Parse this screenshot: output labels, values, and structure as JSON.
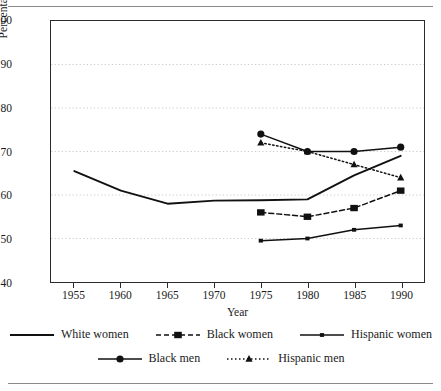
{
  "chart_data": {
    "type": "line",
    "title": "",
    "xlabel": "Year",
    "ylabel": "Percentage of White Men's Income",
    "xlim": [
      1952.5,
      1992.5
    ],
    "ylim": [
      40,
      100
    ],
    "xticks": [
      1955,
      1960,
      1965,
      1970,
      1975,
      1980,
      1985,
      1990
    ],
    "yticks": [
      40,
      50,
      60,
      70,
      80,
      90,
      100
    ],
    "grid": "horizontal-dotted",
    "legend_position": "below-axis",
    "series": [
      {
        "name": "White women",
        "style": "solid",
        "marker": "none",
        "x": [
          1955,
          1960,
          1965,
          1970,
          1975,
          1980,
          1985,
          1990
        ],
        "values": [
          65.5,
          61.0,
          58.0,
          58.7,
          58.8,
          59.0,
          64.5,
          69.0
        ]
      },
      {
        "name": "Black women",
        "style": "dashed",
        "marker": "square",
        "x": [
          1975,
          1980,
          1985,
          1990
        ],
        "values": [
          56.0,
          55.0,
          57.0,
          61.0
        ]
      },
      {
        "name": "Hispanic women",
        "style": "solid",
        "marker": "small-square",
        "x": [
          1975,
          1980,
          1985,
          1990
        ],
        "values": [
          49.5,
          50.0,
          52.0,
          53.0
        ]
      },
      {
        "name": "Black men",
        "style": "solid",
        "marker": "circle",
        "x": [
          1975,
          1980,
          1985,
          1990
        ],
        "values": [
          74.0,
          70.0,
          70.0,
          71.0
        ]
      },
      {
        "name": "Hispanic men",
        "style": "dotted",
        "marker": "triangle",
        "x": [
          1975,
          1980,
          1985,
          1990
        ],
        "values": [
          72.0,
          70.0,
          67.0,
          64.0
        ]
      }
    ]
  },
  "axis": {
    "ylabel": "Percentage of White Men's Income",
    "xlabel": "Year",
    "yticks": [
      "100",
      "90",
      "80",
      "70",
      "60",
      "50",
      "40"
    ],
    "xticks": [
      "1955",
      "1960",
      "1965",
      "1970",
      "1975",
      "1980",
      "1985",
      "1990"
    ]
  },
  "legend": {
    "row1": [
      {
        "label": "White women"
      },
      {
        "label": "Black women"
      },
      {
        "label": "Hispanic women"
      }
    ],
    "row2": [
      {
        "label": "Black men"
      },
      {
        "label": "Hispanic men"
      }
    ]
  },
  "colors": {
    "ink": "#1a1a1a",
    "frame": "#2b2b2b",
    "grid": "#c9c9c9",
    "rule": "#8a8a8a"
  }
}
